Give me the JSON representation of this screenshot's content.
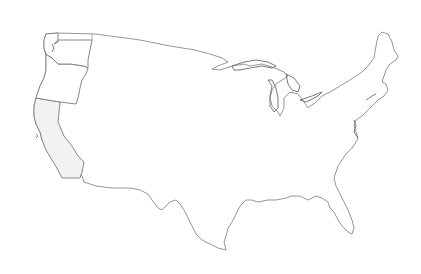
{
  "map": {
    "subject": "Contiguous United States outline map",
    "style": "hand-drawn line outline, white fill",
    "highlighted_states": [
      {
        "name": "Washington",
        "fill": "#ffffff"
      },
      {
        "name": "Oregon",
        "fill": "#ffffff"
      },
      {
        "name": "California",
        "fill": "#f2f2f2"
      }
    ],
    "colors": {
      "background": "#ffffff",
      "outline": "#8a8a8a",
      "state_border": "#7a7a7a",
      "california_shade": "#f2f2f2"
    }
  }
}
